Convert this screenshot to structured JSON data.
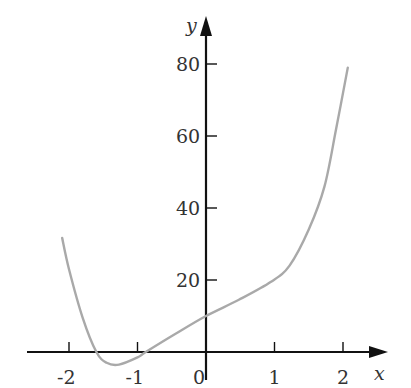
{
  "chart_data": {
    "type": "line",
    "title": "",
    "xlabel": "x",
    "ylabel": "y",
    "xlim": [
      -2.6,
      2.6
    ],
    "ylim": [
      -5,
      90
    ],
    "grid": false,
    "legend": null,
    "x_ticks": [
      "-2",
      "-1",
      "0",
      "1",
      "2"
    ],
    "y_ticks": [
      "20",
      "40",
      "60",
      "80"
    ],
    "series": [
      {
        "name": "f(x)",
        "color": "#a9a9a9",
        "x": [
          -2.1,
          -2.0,
          -1.8,
          -1.6,
          -1.45,
          -1.27,
          -1.0,
          -0.88,
          -0.45,
          0.0,
          0.48,
          0.95,
          1.22,
          1.5,
          1.73,
          1.9,
          2.07
        ],
        "y": [
          31.7,
          23,
          9.5,
          0,
          -3,
          -3.5,
          -1.5,
          0,
          5,
          10,
          14.5,
          19.5,
          24,
          34,
          46,
          62,
          79
        ]
      }
    ]
  },
  "axes": {
    "x_label": "x",
    "y_label": "y",
    "x_ticks": [
      {
        "value": -2,
        "label": "-2"
      },
      {
        "value": -1,
        "label": "-1"
      },
      {
        "value": 0,
        "label": "0"
      },
      {
        "value": 1,
        "label": "1"
      },
      {
        "value": 2,
        "label": "2"
      }
    ],
    "y_ticks": [
      {
        "value": 20,
        "label": "20"
      },
      {
        "value": 40,
        "label": "40"
      },
      {
        "value": 60,
        "label": "60"
      },
      {
        "value": 80,
        "label": "80"
      }
    ]
  },
  "colors": {
    "axis": "#111111",
    "curve": "#a9a9a9",
    "text": "#333333"
  }
}
